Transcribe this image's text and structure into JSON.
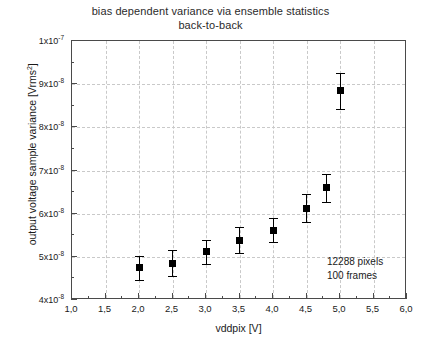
{
  "chart_data": {
    "type": "scatter",
    "title": "bias dependent variance via ensemble statistics",
    "subtitle": "back-to-back",
    "xlabel": "vddpix [V]",
    "ylabel": "output voltage sample variance [Vrms²]",
    "xlim": [
      1.0,
      6.0
    ],
    "ylim": [
      4e-08,
      1e-07
    ],
    "grid": true,
    "legend_position": "none",
    "x": [
      2.0,
      2.5,
      3.0,
      3.5,
      4.0,
      4.5,
      4.8,
      5.0
    ],
    "values": [
      4.75e-08,
      4.85e-08,
      5.12e-08,
      5.38e-08,
      5.62e-08,
      6.13e-08,
      6.6e-08,
      8.85e-08
    ],
    "yerr": [
      2.8e-09,
      3e-09,
      2.8e-09,
      3e-09,
      2.8e-09,
      3.3e-09,
      3.3e-09,
      4.2e-09
    ],
    "marker": "filled-square",
    "marker_color": "#000000",
    "xticks": [
      {
        "value": 1.0,
        "label": "1,0"
      },
      {
        "value": 1.5,
        "label": "1,5"
      },
      {
        "value": 2.0,
        "label": "2,0"
      },
      {
        "value": 2.5,
        "label": "2,5"
      },
      {
        "value": 3.0,
        "label": "3,0"
      },
      {
        "value": 3.5,
        "label": "3,5"
      },
      {
        "value": 4.0,
        "label": "4,0"
      },
      {
        "value": 4.5,
        "label": "4,5"
      },
      {
        "value": 5.0,
        "label": "5,0"
      },
      {
        "value": 5.5,
        "label": "5,5"
      },
      {
        "value": 6.0,
        "label": "6,0"
      }
    ],
    "yticks": [
      {
        "value": 1e-07,
        "mantissa": "1x10",
        "exponent": "-7"
      },
      {
        "value": 9e-08,
        "mantissa": "9x10",
        "exponent": "-8"
      },
      {
        "value": 8e-08,
        "mantissa": "8x10",
        "exponent": "-8"
      },
      {
        "value": 7e-08,
        "mantissa": "7x10",
        "exponent": "-8"
      },
      {
        "value": 6e-08,
        "mantissa": "6x10",
        "exponent": "-8"
      },
      {
        "value": 5e-08,
        "mantissa": "5x10",
        "exponent": "-8"
      },
      {
        "value": 4e-08,
        "mantissa": "4x10",
        "exponent": "-8"
      }
    ],
    "annotations": [
      {
        "text": "12288 pixels"
      },
      {
        "text": "100 frames"
      }
    ]
  },
  "axis_labels": {
    "y_title_main": "output voltage sample variance [Vrms",
    "y_title_sup": "2",
    "y_title_tail": "]",
    "x_title": "vddpix [V]"
  },
  "colors": {
    "axis": "#4a4a4a",
    "grid": "#c9c9c9",
    "marker": "#000000",
    "text": "#1a1a1a",
    "background": "#ffffff"
  }
}
